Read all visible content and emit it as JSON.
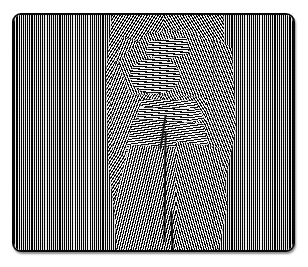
{
  "image": {
    "kind": "op-art-moire-illustration",
    "title": "Striped line-pattern plate with distorted central figure",
    "description": "A rounded-corner rectangular plate filled with fine vertical black-and-white line grating; in the central vertical band the lines bend into diagonals and near-horizontals, revealing the silhouette of a standing figure.",
    "canvas": {
      "width_px": 308,
      "height_px": 267,
      "background_color": "#ffffff"
    },
    "plate": {
      "x_px": 12,
      "y_px": 13,
      "width_px": 283,
      "height_px": 239,
      "corner_radius_px": 9,
      "border_color": "#0a0a0a",
      "border_width_px": 2,
      "fill_color": "#ffffff",
      "has_drop_shadow": true
    },
    "pattern": {
      "type": "line-grating",
      "base_orientation": "vertical",
      "line_color": "#000000",
      "gap_color": "#f4f4f4",
      "period_px": 2.15,
      "line_width_px": 1.05,
      "approx_line_count": 130
    },
    "regions": [
      {
        "name": "left-field",
        "label": "Undisturbed vertical grating (left)",
        "x_px": 14,
        "width_px": 86,
        "orientation_deg": 90
      },
      {
        "name": "figure-field",
        "label": "Distorted grating revealing figure",
        "x_px": 100,
        "width_px": 111,
        "orientation_deg": "varies 4-122"
      },
      {
        "name": "right-field",
        "label": "Undisturbed vertical grating (right)",
        "x_px": 211,
        "width_px": 82,
        "orientation_deg": 90
      }
    ],
    "figure": {
      "label": "Standing figure silhouette",
      "head": {
        "cx_px": 153,
        "cy_px": 74,
        "rx_px": 26,
        "ry_px": 18
      },
      "shoulders_y_px": 100,
      "waist_y_px": 130,
      "hem_y_px": 240,
      "center_seam_x_px": 162,
      "seam_color": "#0d0d0d"
    },
    "colors": {
      "ink": "#000000",
      "paper": "#ffffff",
      "gap": "#f4f4f4",
      "border": "#0a0a0a",
      "seam": "#0d0d0d"
    }
  }
}
